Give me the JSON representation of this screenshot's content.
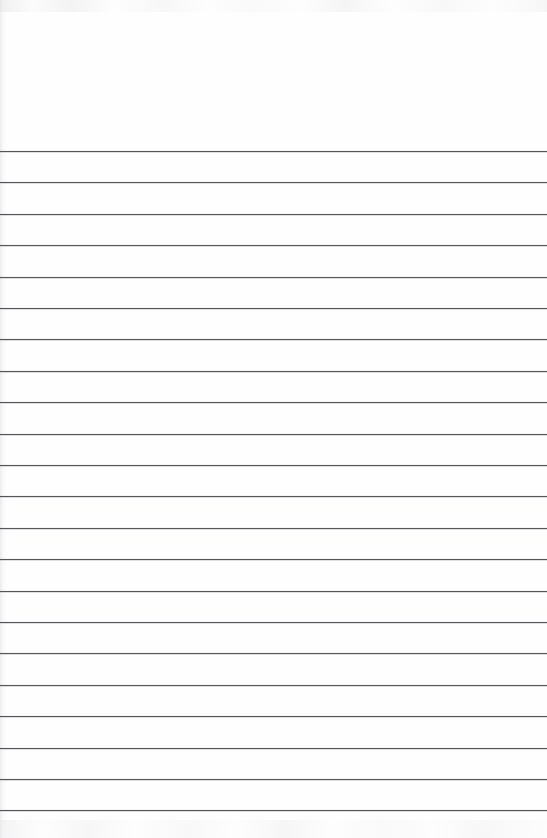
{
  "document": {
    "kind": "scanned-lined-notebook-page",
    "title": "Blank Ruled Notebook Page",
    "content_text": "",
    "is_blank": true,
    "page_width_px": 547,
    "page_height_px": 838
  },
  "paper": {
    "background_color": "#fefefe",
    "canvas_color": "#ffffff",
    "edge_tint_color": "#e2e2e5",
    "noise_color": "#ececef"
  },
  "ruling": {
    "style": "wide-ruled",
    "line_color": "#54565c",
    "line_thickness_px": 1,
    "line_count": 22,
    "line_spacing_px": 31.4,
    "first_line_y_px": 151,
    "last_line_y_px": 811,
    "left_inset_px": 0,
    "right_inset_px": 0,
    "header_margin_height_px": 151,
    "has_vertical_margin_rule": false,
    "line_y_positions": [
      151,
      182.4,
      213.8,
      245.2,
      276.6,
      308,
      339.4,
      370.8,
      402.2,
      433.6,
      465,
      496.4,
      527.8,
      559.2,
      590.6,
      622,
      653.4,
      684.8,
      716.2,
      747.6,
      779,
      810.4
    ],
    "line_right_end_px": [
      547,
      547,
      547,
      547,
      547,
      547,
      547,
      547,
      547,
      547,
      547,
      547,
      547,
      547,
      547,
      547,
      547,
      547,
      547,
      547,
      547,
      547
    ]
  },
  "regions": {
    "header_margin_label": "",
    "writing_area_label": ""
  }
}
